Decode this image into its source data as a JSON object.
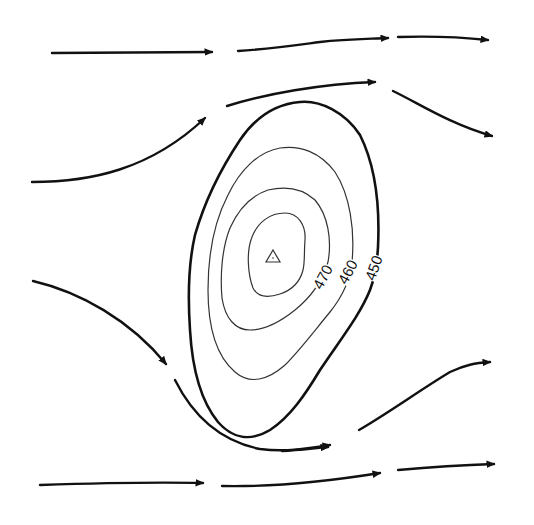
{
  "diagram": {
    "type": "streamlines-around-high-pressure-contours",
    "colors": {
      "line": "#111111",
      "thin_line": "#333333",
      "background": "#ffffff"
    },
    "contours": [
      {
        "value": "450",
        "weight": "thick",
        "label": "450"
      },
      {
        "value": "460",
        "weight": "thin",
        "label": "460"
      },
      {
        "value": "470",
        "weight": "thin",
        "label": "470"
      },
      {
        "value": "",
        "weight": "thin",
        "label": ""
      }
    ],
    "center_marker": {
      "symbol": "triangle",
      "meaning": "high-center"
    },
    "streamline_count": 14
  }
}
